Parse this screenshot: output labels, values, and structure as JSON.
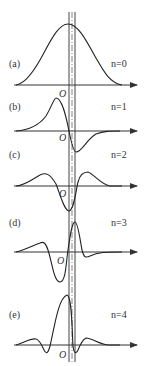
{
  "figure": {
    "panels": [
      {
        "label": "(a)",
        "n_label": "n=0",
        "origin_label": "O"
      },
      {
        "label": "(b)",
        "n_label": "n=1",
        "origin_label": "O"
      },
      {
        "label": "(c)",
        "n_label": "n=2",
        "origin_label": "O"
      },
      {
        "label": "(d)",
        "n_label": "n=3",
        "origin_label": "O"
      },
      {
        "label": "(e)",
        "n_label": "n=4",
        "origin_label": "O"
      }
    ],
    "colors": {
      "line": "#222222",
      "axis": "#333333",
      "background": "#ffffff"
    }
  }
}
